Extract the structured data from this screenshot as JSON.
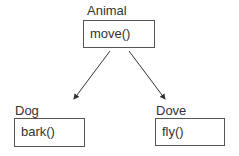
{
  "diagram": {
    "type": "class-hierarchy",
    "classes": [
      {
        "id": "animal",
        "name": "Animal",
        "method": "move()"
      },
      {
        "id": "dog",
        "name": "Dog",
        "method": "bark()"
      },
      {
        "id": "dove",
        "name": "Dove",
        "method": "fly()"
      }
    ],
    "edges": [
      {
        "from": "animal",
        "to": "dog"
      },
      {
        "from": "animal",
        "to": "dove"
      }
    ],
    "colors": {
      "line": "#333333",
      "border": "#555555",
      "text": "#333333"
    }
  }
}
